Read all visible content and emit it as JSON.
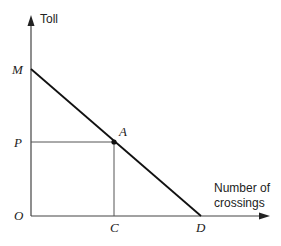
{
  "diagram": {
    "type": "demand-curve",
    "y_axis": {
      "label": "Toll"
    },
    "x_axis": {
      "label_line1": "Number of",
      "label_line2": "crossings"
    },
    "points": {
      "origin": "O",
      "y_intercept": "M",
      "x_intercept": "D",
      "point_on_line": "A",
      "price_level": "P",
      "quantity_level": "C"
    },
    "colors": {
      "line": "#111111",
      "axis": "#444444",
      "guide": "#555555"
    }
  }
}
